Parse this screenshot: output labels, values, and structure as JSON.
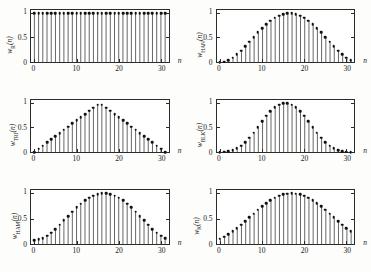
{
  "figure": {
    "background": "#fdfdfc",
    "ink": "#2b2b2b",
    "marker_color": "#111111",
    "stem_color": "#333333"
  },
  "axes": {
    "x_ticks": [
      "0",
      "10",
      "20",
      "30"
    ],
    "x_tick_values": [
      0,
      10,
      20,
      30
    ],
    "y_ticks": [
      "0",
      "0.5",
      "1"
    ],
    "y_tick_values": [
      0,
      0.5,
      1
    ],
    "xlabel": "n",
    "xlim": [
      -0.8,
      31.8
    ],
    "ylim": [
      0,
      1.06
    ]
  },
  "chart_data": [
    {
      "type": "line",
      "panel": "top-left",
      "title": "",
      "name": "rectangular",
      "ylabel_main": "w",
      "ylabel_sub": "R",
      "ylabel_arg": "(n)",
      "xlabel": "n",
      "x": [
        0,
        1,
        2,
        3,
        4,
        5,
        6,
        7,
        8,
        9,
        10,
        11,
        12,
        13,
        14,
        15,
        16,
        17,
        18,
        19,
        20,
        21,
        22,
        23,
        24,
        25,
        26,
        27,
        28,
        29,
        30,
        31
      ],
      "values": [
        1,
        1,
        1,
        1,
        1,
        1,
        1,
        1,
        1,
        1,
        1,
        1,
        1,
        1,
        1,
        1,
        1,
        1,
        1,
        1,
        1,
        1,
        1,
        1,
        1,
        1,
        1,
        1,
        1,
        1,
        1,
        1
      ],
      "xlim": [
        -0.8,
        31.8
      ],
      "ylim": [
        0,
        1.06
      ],
      "grid": false
    },
    {
      "type": "line",
      "panel": "top-right",
      "title": "",
      "name": "hann",
      "ylabel_main": "w",
      "ylabel_sub": "HAN",
      "ylabel_arg": "(n)",
      "xlabel": "n",
      "x": [
        0,
        1,
        2,
        3,
        4,
        5,
        6,
        7,
        8,
        9,
        10,
        11,
        12,
        13,
        14,
        15,
        16,
        17,
        18,
        19,
        20,
        21,
        22,
        23,
        24,
        25,
        26,
        27,
        28,
        29,
        30,
        31
      ],
      "values": [
        0,
        0.01,
        0.041,
        0.09,
        0.155,
        0.233,
        0.321,
        0.413,
        0.508,
        0.602,
        0.691,
        0.773,
        0.843,
        0.901,
        0.944,
        0.973,
        0.99,
        0.99,
        0.973,
        0.944,
        0.901,
        0.843,
        0.773,
        0.691,
        0.602,
        0.508,
        0.413,
        0.321,
        0.233,
        0.155,
        0.09,
        0.041
      ],
      "xlim": [
        -0.8,
        31.8
      ],
      "ylim": [
        0,
        1.06
      ],
      "grid": false
    },
    {
      "type": "line",
      "panel": "middle-left",
      "title": "",
      "name": "triangular",
      "ylabel_main": "w",
      "ylabel_sub": "TRI",
      "ylabel_arg": "(n)",
      "xlabel": "n",
      "x": [
        0,
        1,
        2,
        3,
        4,
        5,
        6,
        7,
        8,
        9,
        10,
        11,
        12,
        13,
        14,
        15,
        16,
        17,
        18,
        19,
        20,
        21,
        22,
        23,
        24,
        25,
        26,
        27,
        28,
        29,
        30,
        31
      ],
      "values": [
        0,
        0.065,
        0.129,
        0.194,
        0.258,
        0.323,
        0.387,
        0.452,
        0.516,
        0.581,
        0.645,
        0.71,
        0.774,
        0.839,
        0.903,
        0.968,
        0.968,
        0.903,
        0.839,
        0.774,
        0.71,
        0.645,
        0.581,
        0.516,
        0.452,
        0.387,
        0.323,
        0.258,
        0.194,
        0.129,
        0.065,
        0
      ],
      "xlim": [
        -0.8,
        31.8
      ],
      "ylim": [
        0,
        1.06
      ],
      "grid": false
    },
    {
      "type": "line",
      "panel": "middle-right",
      "title": "",
      "name": "blackman",
      "ylabel_main": "w",
      "ylabel_sub": "BLK",
      "ylabel_arg": "(n)",
      "xlabel": "n",
      "x": [
        0,
        1,
        2,
        3,
        4,
        5,
        6,
        7,
        8,
        9,
        10,
        11,
        12,
        13,
        14,
        15,
        16,
        17,
        18,
        19,
        20,
        21,
        22,
        23,
        24,
        25,
        26,
        27,
        28,
        29,
        30,
        31
      ],
      "values": [
        0,
        0.004,
        0.017,
        0.041,
        0.078,
        0.13,
        0.2,
        0.288,
        0.392,
        0.507,
        0.625,
        0.738,
        0.837,
        0.915,
        0.967,
        0.993,
        0.993,
        0.967,
        0.915,
        0.837,
        0.738,
        0.625,
        0.507,
        0.392,
        0.288,
        0.2,
        0.13,
        0.078,
        0.041,
        0.017,
        0.004,
        0
      ],
      "xlim": [
        -0.8,
        31.8
      ],
      "ylim": [
        0,
        1.06
      ],
      "grid": false
    },
    {
      "type": "line",
      "panel": "bottom-left",
      "title": "",
      "name": "hamming",
      "ylabel_main": "w",
      "ylabel_sub": "HAM",
      "ylabel_arg": "(n)",
      "xlabel": "n",
      "x": [
        0,
        1,
        2,
        3,
        4,
        5,
        6,
        7,
        8,
        9,
        10,
        11,
        12,
        13,
        14,
        15,
        16,
        17,
        18,
        19,
        20,
        21,
        22,
        23,
        24,
        25,
        26,
        27,
        28,
        29,
        30,
        31
      ],
      "values": [
        0.08,
        0.089,
        0.118,
        0.163,
        0.224,
        0.296,
        0.377,
        0.462,
        0.55,
        0.636,
        0.718,
        0.793,
        0.858,
        0.911,
        0.951,
        0.978,
        0.993,
        0.993,
        0.978,
        0.951,
        0.911,
        0.858,
        0.793,
        0.718,
        0.636,
        0.55,
        0.462,
        0.377,
        0.296,
        0.224,
        0.163,
        0.118
      ],
      "xlim": [
        -0.8,
        31.8
      ],
      "ylim": [
        0,
        1.06
      ],
      "grid": false
    },
    {
      "type": "line",
      "panel": "bottom-right",
      "title": "",
      "name": "kaiser",
      "ylabel_main": "w",
      "ylabel_sub": "K",
      "ylabel_arg": "(n)",
      "xlabel": "n",
      "x": [
        0,
        1,
        2,
        3,
        4,
        5,
        6,
        7,
        8,
        9,
        10,
        11,
        12,
        13,
        14,
        15,
        16,
        17,
        18,
        19,
        20,
        21,
        22,
        23,
        24,
        25,
        26,
        27,
        28,
        29,
        30,
        31
      ],
      "values": [
        0.105,
        0.145,
        0.193,
        0.248,
        0.31,
        0.378,
        0.449,
        0.523,
        0.598,
        0.671,
        0.74,
        0.804,
        0.86,
        0.907,
        0.945,
        0.972,
        0.989,
        0.996,
        0.989,
        0.972,
        0.945,
        0.907,
        0.86,
        0.804,
        0.74,
        0.671,
        0.598,
        0.523,
        0.449,
        0.378,
        0.31,
        0.248
      ],
      "xlim": [
        -0.8,
        31.8
      ],
      "ylim": [
        0,
        1.06
      ],
      "grid": false
    }
  ]
}
